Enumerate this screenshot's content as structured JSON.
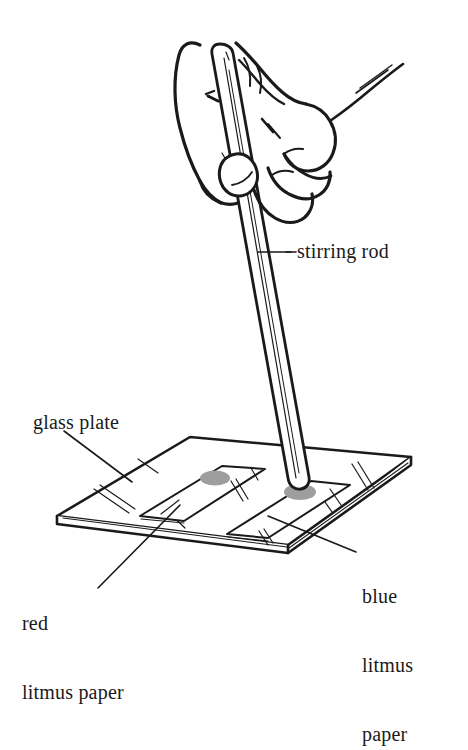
{
  "figure": {
    "background_color": "#ffffff",
    "ink_color": "#1a1a1a",
    "spot_color": "#9e9e9e",
    "width": 468,
    "height": 637
  },
  "labels": {
    "stirring_rod": "stirring rod",
    "glass_plate": "glass plate",
    "red_litmus_line1": "red",
    "red_litmus_line2": "litmus paper",
    "blue_litmus_line1": "blue",
    "blue_litmus_line2": "litmus",
    "blue_litmus_line3": "paper"
  },
  "parts": [
    {
      "name": "hand",
      "description": "hand gripping a stirring rod"
    },
    {
      "name": "stirring-rod",
      "description": "long glass rod held vertically, tip touching blue litmus paper"
    },
    {
      "name": "glass-plate",
      "description": "square glass plate in perspective"
    },
    {
      "name": "red-litmus-paper",
      "description": "left paper strip on plate"
    },
    {
      "name": "blue-litmus-paper",
      "description": "right paper strip on plate"
    },
    {
      "name": "red-litmus-spot",
      "description": "grey drop mark on red litmus paper"
    },
    {
      "name": "blue-litmus-spot",
      "description": "grey drop mark on blue litmus paper at rod tip"
    }
  ]
}
